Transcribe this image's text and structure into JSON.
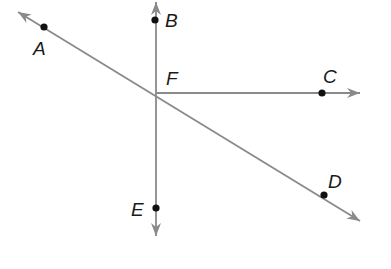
{
  "diagram": {
    "type": "geometry-lines-and-rays",
    "colors": {
      "line": "#8a8a8a",
      "point": "#111111",
      "label": "#1a1a1a",
      "background": "#ffffff"
    },
    "intersection": {
      "label": "F",
      "x": 156,
      "y": 93
    },
    "points": [
      {
        "id": "A",
        "label": "A",
        "x": 44,
        "y": 27,
        "label_x": 33,
        "label_y": 55
      },
      {
        "id": "B",
        "label": "B",
        "x": 155,
        "y": 20,
        "label_x": 165,
        "label_y": 27
      },
      {
        "id": "C",
        "label": "C",
        "x": 322,
        "y": 93,
        "label_x": 323,
        "label_y": 83
      },
      {
        "id": "D",
        "label": "D",
        "x": 324,
        "y": 195,
        "label_x": 328,
        "label_y": 188
      },
      {
        "id": "E",
        "label": "E",
        "x": 156,
        "y": 208,
        "label_x": 131,
        "label_y": 216
      },
      {
        "id": "F",
        "label": "F",
        "x": 156,
        "y": 93,
        "label_x": 166,
        "label_y": 85
      }
    ],
    "lines": [
      {
        "id": "line-BE",
        "description": "vertical line through B, F, E",
        "x1": 156,
        "y1": 2,
        "x2": 156,
        "y2": 236,
        "arrow_start": true,
        "arrow_end": true
      },
      {
        "id": "line-AD",
        "description": "diagonal line through A, F, D",
        "x1": 18,
        "y1": 12,
        "x2": 360,
        "y2": 221,
        "arrow_start": true,
        "arrow_end": true
      },
      {
        "id": "ray-FC",
        "description": "ray from F through C",
        "x1": 156,
        "y1": 93,
        "x2": 360,
        "y2": 93,
        "arrow_start": false,
        "arrow_end": true
      }
    ]
  }
}
